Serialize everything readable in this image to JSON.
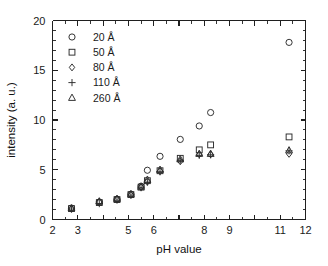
{
  "chart_data": {
    "type": "scatter",
    "title": "",
    "xlabel": "pH value",
    "ylabel": "intensity (a. u.)",
    "xlim": [
      2,
      12
    ],
    "ylim": [
      0,
      20
    ],
    "xticks": [
      2,
      3,
      4,
      5,
      6,
      7,
      8,
      9,
      10,
      11,
      12
    ],
    "xticklabels": [
      "2",
      "3",
      "",
      "5",
      "6",
      "",
      "8",
      "9",
      "",
      "11",
      "12"
    ],
    "yticks": [
      0,
      5,
      10,
      15,
      20
    ],
    "yticklabels": [
      "0",
      "5",
      "10",
      "15",
      "20"
    ],
    "xminor_step": 0.5,
    "yminor_step": 1,
    "grid": false,
    "legend_position": "upper left",
    "series": [
      {
        "name": "20 Å",
        "marker": "circle",
        "points": [
          {
            "x": 2.75,
            "y": 1.15
          },
          {
            "x": 3.85,
            "y": 1.75
          },
          {
            "x": 4.55,
            "y": 2.05
          },
          {
            "x": 5.1,
            "y": 2.55
          },
          {
            "x": 5.5,
            "y": 3.35
          },
          {
            "x": 5.75,
            "y": 4.95
          },
          {
            "x": 6.25,
            "y": 6.35
          },
          {
            "x": 7.05,
            "y": 8.05
          },
          {
            "x": 7.8,
            "y": 9.4
          },
          {
            "x": 8.25,
            "y": 10.75
          },
          {
            "x": 11.35,
            "y": 17.8
          }
        ]
      },
      {
        "name": "50 Å",
        "marker": "square",
        "points": [
          {
            "x": 2.75,
            "y": 1.1
          },
          {
            "x": 3.85,
            "y": 1.7
          },
          {
            "x": 4.55,
            "y": 2.0
          },
          {
            "x": 5.1,
            "y": 2.5
          },
          {
            "x": 5.5,
            "y": 3.25
          },
          {
            "x": 5.75,
            "y": 3.9
          },
          {
            "x": 6.25,
            "y": 4.9
          },
          {
            "x": 7.05,
            "y": 6.15
          },
          {
            "x": 7.8,
            "y": 7.0
          },
          {
            "x": 8.25,
            "y": 7.5
          },
          {
            "x": 11.35,
            "y": 8.3
          }
        ]
      },
      {
        "name": "80 Å",
        "marker": "diamond",
        "points": [
          {
            "x": 2.75,
            "y": 1.08
          },
          {
            "x": 3.85,
            "y": 1.78
          },
          {
            "x": 4.55,
            "y": 2.02
          },
          {
            "x": 5.1,
            "y": 2.48
          },
          {
            "x": 5.5,
            "y": 3.25
          },
          {
            "x": 5.75,
            "y": 3.8
          },
          {
            "x": 6.25,
            "y": 4.85
          },
          {
            "x": 7.05,
            "y": 5.85
          },
          {
            "x": 7.8,
            "y": 6.55
          },
          {
            "x": 8.25,
            "y": 6.55
          },
          {
            "x": 11.35,
            "y": 6.6
          }
        ]
      },
      {
        "name": "110 Å",
        "marker": "plus",
        "points": [
          {
            "x": 2.75,
            "y": 1.05
          },
          {
            "x": 3.85,
            "y": 1.6
          },
          {
            "x": 4.55,
            "y": 1.95
          },
          {
            "x": 5.1,
            "y": 2.45
          },
          {
            "x": 5.5,
            "y": 3.2
          },
          {
            "x": 5.75,
            "y": 3.75
          },
          {
            "x": 6.25,
            "y": 4.8
          },
          {
            "x": 7.05,
            "y": 5.95
          },
          {
            "x": 7.8,
            "y": 6.45
          },
          {
            "x": 8.25,
            "y": 6.5
          },
          {
            "x": 11.35,
            "y": 6.9
          }
        ]
      },
      {
        "name": "260 Å",
        "marker": "triangle",
        "points": [
          {
            "x": 2.75,
            "y": 1.12
          },
          {
            "x": 3.85,
            "y": 1.82
          },
          {
            "x": 4.55,
            "y": 2.08
          },
          {
            "x": 5.1,
            "y": 2.55
          },
          {
            "x": 5.5,
            "y": 3.3
          },
          {
            "x": 5.75,
            "y": 4.0
          },
          {
            "x": 6.25,
            "y": 5.0
          },
          {
            "x": 7.05,
            "y": 6.05
          },
          {
            "x": 7.8,
            "y": 6.6
          },
          {
            "x": 8.25,
            "y": 6.6
          },
          {
            "x": 11.35,
            "y": 6.95
          }
        ]
      }
    ]
  },
  "legend": {
    "entries": [
      {
        "label": "20 Å",
        "marker": "circle"
      },
      {
        "label": "50 Å",
        "marker": "square"
      },
      {
        "label": "80 Å",
        "marker": "diamond"
      },
      {
        "label": "110 Å",
        "marker": "plus"
      },
      {
        "label": "260 Å",
        "marker": "triangle"
      }
    ]
  },
  "colors": {
    "axis": "#1f1f1f",
    "marker": "#2b2b2b",
    "background": "#ffffff",
    "text": "#1a1a1a"
  }
}
